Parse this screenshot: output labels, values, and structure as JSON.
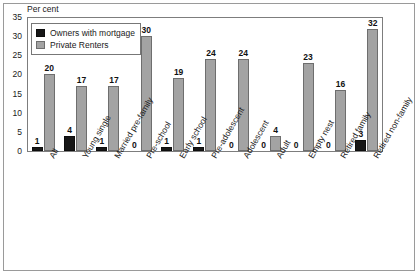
{
  "chart_data": {
    "type": "bar",
    "title": "",
    "xlabel": "",
    "ylabel": "Per cent",
    "ylim": [
      0,
      35
    ],
    "y_ticks": [
      0,
      5,
      10,
      15,
      20,
      25,
      30,
      35
    ],
    "grid": false,
    "legend_position": "top-left-inside",
    "categories": [
      "All",
      "Young single",
      "Married pre-family",
      "Pre-school",
      "Early school",
      "Pre-adolescent",
      "Adolescent",
      "Adult",
      "Empty nest",
      "Retired family",
      "Retired non-family"
    ],
    "series": [
      {
        "name": "Owners with mortgage",
        "color": "#171717",
        "values": [
          1,
          4,
          1,
          0,
          1,
          1,
          0,
          0,
          0,
          0,
          3
        ]
      },
      {
        "name": "Private Renters",
        "color": "#a3a3a3",
        "values": [
          20,
          17,
          17,
          30,
          19,
          24,
          24,
          4,
          23,
          16,
          32
        ]
      }
    ],
    "data_labels": {
      "owners": [
        "1",
        "4",
        "1",
        "0",
        "1",
        "1",
        "0",
        "0",
        "0",
        "0",
        "3"
      ],
      "renters": [
        "20",
        "17",
        "17",
        "30",
        "19",
        "24",
        "24",
        "4",
        "23",
        "16",
        "32"
      ]
    }
  },
  "axis": {
    "y_title": "Per cent",
    "y_tick_labels": [
      "35",
      "30",
      "25",
      "20",
      "15",
      "10",
      "5",
      "0"
    ]
  },
  "legend": {
    "items": [
      {
        "label": "Owners with mortgage",
        "swatch": "black-swatch"
      },
      {
        "label": "Private Renters",
        "swatch": "gray-swatch"
      }
    ]
  }
}
